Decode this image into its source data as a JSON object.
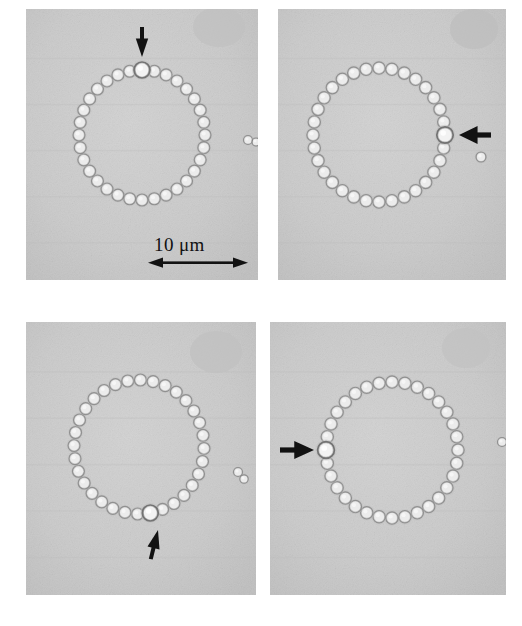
{
  "figure": {
    "type": "micrograph-grid",
    "rows": 2,
    "columns": 2,
    "background_color": "#ffffff",
    "panel_fill": "#c9c9c9",
    "bead_highlight_color": "#f4f4f4",
    "bead_outline_color": "#6f6f6f",
    "arrow_color": "#121212"
  },
  "scale_bar": {
    "label": "10 μm",
    "value": 10,
    "unit": "μm",
    "style": "double-headed-arrow",
    "panel": "top-left",
    "length_px": 100
  },
  "panels": [
    {
      "id": "panel-top-left",
      "position": "top-left",
      "x": 26,
      "y": 9,
      "width": 232,
      "height": 271,
      "ring": {
        "cx": 116,
        "cy": 126,
        "rx": 63,
        "ry": 65,
        "bead_count": 32,
        "bead_radius": 6.0
      },
      "marked_bead": {
        "index": 0,
        "angle_deg": -90,
        "radius": 8.0,
        "label": "tagged-bead"
      },
      "arrow": {
        "direction": "down",
        "name": "marker-arrow-down",
        "tip_x": 116,
        "tip_y": 48,
        "length": 30,
        "style": "slim-spear"
      },
      "satellite_particles": [
        {
          "cx": 222,
          "cy": 131,
          "r": 4.5
        },
        {
          "cx": 230,
          "cy": 133,
          "r": 4.0
        }
      ],
      "blobs": [
        {
          "cx": 193,
          "cy": 18,
          "rx": 26,
          "ry": 20,
          "shade": "#c0c0c0"
        }
      ]
    },
    {
      "id": "panel-top-right",
      "position": "top-right",
      "x": 278,
      "y": 9,
      "width": 228,
      "height": 271,
      "ring": {
        "cx": 101,
        "cy": 126,
        "rx": 66,
        "ry": 67,
        "bead_count": 32,
        "bead_radius": 6.2
      },
      "marked_bead": {
        "index": 0,
        "angle_deg": 0,
        "radius": 8.2,
        "label": "tagged-bead"
      },
      "arrow": {
        "direction": "left",
        "name": "marker-arrow-left",
        "tip_x": 181,
        "tip_y": 126,
        "length": 32,
        "style": "solid-head"
      },
      "satellite_particles": [
        {
          "cx": 203,
          "cy": 148,
          "r": 5.0
        }
      ],
      "blobs": [
        {
          "cx": 196,
          "cy": 20,
          "rx": 24,
          "ry": 20,
          "shade": "#bebebe"
        }
      ]
    },
    {
      "id": "panel-bottom-left",
      "position": "bottom-left",
      "x": 26,
      "y": 322,
      "width": 230,
      "height": 273,
      "ring": {
        "cx": 113,
        "cy": 125,
        "rx": 65,
        "ry": 67,
        "bead_count": 32,
        "bead_radius": 6.0
      },
      "marked_bead": {
        "index": 0,
        "angle_deg": 80,
        "radius": 8.0,
        "label": "tagged-bead"
      },
      "arrow": {
        "direction": "up",
        "name": "marker-arrow-up",
        "tip_x": 132,
        "tip_y": 208,
        "length": 30,
        "style": "slim-spear-tilted",
        "tilt_deg": 14
      },
      "satellite_particles": [
        {
          "cx": 212,
          "cy": 150,
          "r": 4.5
        },
        {
          "cx": 218,
          "cy": 157,
          "r": 4.2
        }
      ],
      "blobs": [
        {
          "cx": 190,
          "cy": 30,
          "rx": 26,
          "ry": 21,
          "shade": "#c0c0c0"
        }
      ]
    },
    {
      "id": "panel-bottom-right",
      "position": "bottom-right",
      "x": 270,
      "y": 322,
      "width": 236,
      "height": 273,
      "ring": {
        "cx": 122,
        "cy": 128,
        "rx": 66,
        "ry": 68,
        "bead_count": 32,
        "bead_radius": 6.2
      },
      "marked_bead": {
        "index": 0,
        "angle_deg": 180,
        "radius": 8.4,
        "label": "tagged-bead"
      },
      "arrow": {
        "direction": "right",
        "name": "marker-arrow-right",
        "tip_x": 44,
        "tip_y": 128,
        "length": 34,
        "style": "solid-head"
      },
      "satellite_particles": [
        {
          "cx": 232,
          "cy": 120,
          "r": 4.5
        }
      ],
      "blobs": [
        {
          "cx": 196,
          "cy": 26,
          "rx": 24,
          "ry": 20,
          "shade": "#c2c2c2"
        }
      ]
    }
  ]
}
